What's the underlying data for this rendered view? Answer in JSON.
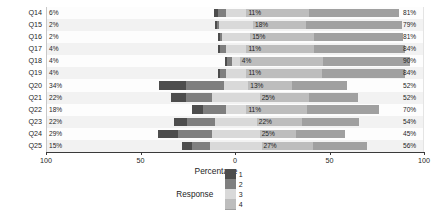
{
  "chart_data": {
    "type": "bar",
    "subtype": "diverging-stacked-likert",
    "title": "",
    "xlabel": "Percentage",
    "ylabel": "",
    "xlim": [
      -100,
      100
    ],
    "xticks": [
      -100,
      -50,
      0,
      50,
      100
    ],
    "xticklabels": [
      "100",
      "50",
      "0",
      "50",
      "100"
    ],
    "grid": false,
    "legend": {
      "title": "Response",
      "position": "bottom",
      "entries": [
        "1",
        "2",
        "3",
        "4",
        "5"
      ]
    },
    "colors": {
      "1": "#4d4d4d",
      "2": "#7f7f7f",
      "3": "#d9d9d9",
      "4": "#bdbdbd",
      "5": "#a0a0a0",
      "band": "#f1f1f1",
      "plot_bg": "#fdfdfd",
      "axis": "#3a3a3a"
    },
    "categories": [
      "Q14",
      "Q15",
      "Q16",
      "Q17",
      "Q18",
      "Q19",
      "Q20",
      "Q21",
      "Q22",
      "Q23",
      "Q24",
      "Q25"
    ],
    "series": [
      {
        "name": "1",
        "values": [
          2,
          1,
          1,
          1,
          1,
          1,
          14,
          8,
          6,
          7,
          11,
          5
        ]
      },
      {
        "name": "2",
        "values": [
          4,
          1,
          1,
          3,
          3,
          3,
          20,
          14,
          12,
          15,
          18,
          10
        ]
      },
      {
        "name": "3",
        "values": [
          11,
          18,
          15,
          11,
          4,
          11,
          13,
          25,
          11,
          22,
          25,
          27
        ]
      },
      {
        "name": "4",
        "values": [
          33,
          28,
          34,
          36,
          44,
          40,
          23,
          26,
          32,
          24,
          19,
          27
        ]
      },
      {
        "name": "5",
        "values": [
          48,
          51,
          47,
          48,
          46,
          44,
          29,
          26,
          38,
          30,
          26,
          29
        ]
      }
    ],
    "rows": [
      {
        "label": "Q14",
        "negative_label": "6%",
        "neutral_label": "11%",
        "positive_label": "81%",
        "negative_total": 6,
        "neutral": 11,
        "positive_total": 81,
        "s1": 2,
        "s2": 4,
        "s4": 33,
        "s5": 48
      },
      {
        "label": "Q15",
        "negative_label": "2%",
        "neutral_label": "18%",
        "positive_label": "79%",
        "negative_total": 2,
        "neutral": 18,
        "positive_total": 79,
        "s1": 1,
        "s2": 1,
        "s4": 28,
        "s5": 51
      },
      {
        "label": "Q16",
        "negative_label": "2%",
        "neutral_label": "15%",
        "positive_label": "81%",
        "negative_total": 2,
        "neutral": 15,
        "positive_total": 81,
        "s1": 1,
        "s2": 1,
        "s4": 34,
        "s5": 47
      },
      {
        "label": "Q17",
        "negative_label": "4%",
        "neutral_label": "11%",
        "positive_label": "84%",
        "negative_total": 4,
        "neutral": 11,
        "positive_total": 84,
        "s1": 1,
        "s2": 3,
        "s4": 36,
        "s5": 48
      },
      {
        "label": "Q18",
        "negative_label": "4%",
        "neutral_label": "4%",
        "positive_label": "90%",
        "negative_total": 4,
        "neutral": 4,
        "positive_total": 90,
        "s1": 1,
        "s2": 3,
        "s4": 44,
        "s5": 46
      },
      {
        "label": "Q19",
        "negative_label": "4%",
        "neutral_label": "11%",
        "positive_label": "84%",
        "negative_total": 4,
        "neutral": 11,
        "positive_total": 84,
        "s1": 1,
        "s2": 3,
        "s4": 40,
        "s5": 44
      },
      {
        "label": "Q20",
        "negative_label": "34%",
        "neutral_label": "13%",
        "positive_label": "52%",
        "negative_total": 34,
        "neutral": 13,
        "positive_total": 52,
        "s1": 14,
        "s2": 20,
        "s4": 23,
        "s5": 29
      },
      {
        "label": "Q21",
        "negative_label": "22%",
        "neutral_label": "25%",
        "positive_label": "52%",
        "negative_total": 22,
        "neutral": 25,
        "positive_total": 52,
        "s1": 8,
        "s2": 14,
        "s4": 26,
        "s5": 26
      },
      {
        "label": "Q22",
        "negative_label": "18%",
        "neutral_label": "11%",
        "positive_label": "70%",
        "negative_total": 18,
        "neutral": 11,
        "positive_total": 70,
        "s1": 6,
        "s2": 12,
        "s4": 32,
        "s5": 38
      },
      {
        "label": "Q23",
        "negative_label": "22%",
        "neutral_label": "22%",
        "positive_label": "54%",
        "negative_total": 22,
        "neutral": 22,
        "positive_total": 54,
        "s1": 7,
        "s2": 15,
        "s4": 24,
        "s5": 30
      },
      {
        "label": "Q24",
        "negative_label": "29%",
        "neutral_label": "25%",
        "positive_label": "45%",
        "negative_total": 29,
        "neutral": 25,
        "positive_total": 45,
        "s1": 11,
        "s2": 18,
        "s4": 19,
        "s5": 26
      },
      {
        "label": "Q25",
        "negative_label": "15%",
        "neutral_label": "27%",
        "positive_label": "56%",
        "negative_total": 15,
        "neutral": 27,
        "positive_total": 56,
        "s1": 5,
        "s2": 10,
        "s4": 27,
        "s5": 29
      }
    ]
  }
}
